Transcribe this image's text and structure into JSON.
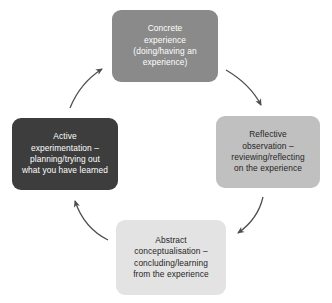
{
  "diagram": {
    "type": "cycle-diagram",
    "direction": "clockwise",
    "background_color": "#ffffff",
    "arrow_color": "#4d4d4d"
  },
  "nodes": [
    {
      "id": "concrete-experience",
      "label": "Concrete\nexperience\n(doing/having an\nexperience)",
      "fill_color": "#8a8a8a",
      "text_color": "#ffffff",
      "position": "top"
    },
    {
      "id": "reflective-observation",
      "label": "Reflective\nobservation –\nreviewing/reflecting\non the experience",
      "fill_color": "#c0c0c0",
      "text_color": "#262626",
      "position": "right"
    },
    {
      "id": "abstract-conceptualisation",
      "label": "Abstract\nconceptualisation –\nconcluding/learning\nfrom the experience",
      "fill_color": "#e3e3e3",
      "text_color": "#262626",
      "position": "bottom"
    },
    {
      "id": "active-experimentation",
      "label": "Active\nexperimentation –\nplanning/trying out\nwhat you have learned",
      "fill_color": "#3d3d3d",
      "text_color": "#ffffff",
      "position": "left"
    }
  ],
  "arrows": [
    {
      "id": "arrow-concrete-to-reflective",
      "from": "concrete-experience",
      "to": "reflective-observation"
    },
    {
      "id": "arrow-reflective-to-abstract",
      "from": "reflective-observation",
      "to": "abstract-conceptualisation"
    },
    {
      "id": "arrow-abstract-to-active",
      "from": "abstract-conceptualisation",
      "to": "active-experimentation"
    },
    {
      "id": "arrow-active-to-concrete",
      "from": "active-experimentation",
      "to": "concrete-experience"
    }
  ]
}
